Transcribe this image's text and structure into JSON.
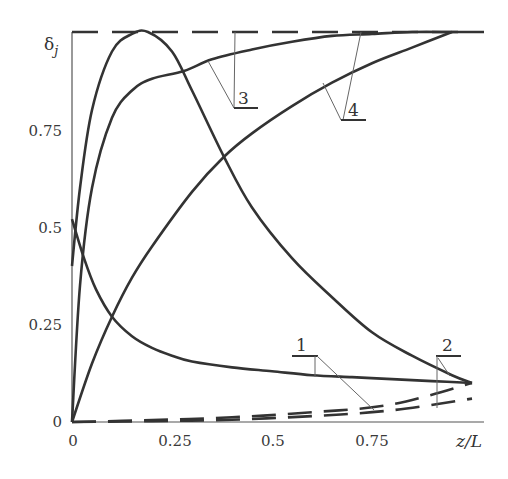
{
  "chart_data": {
    "type": "line",
    "title": "",
    "xlabel": "z/L",
    "ylabel": "δj",
    "xlim": [
      0,
      1.0
    ],
    "ylim": [
      0,
      1.0
    ],
    "grid": false,
    "legend": "leader-line curve labels",
    "x_ticks": [
      "0",
      "0.25",
      "0.5",
      "0.75"
    ],
    "y_ticks": [
      "0",
      "0.25",
      "0.5",
      "0.75"
    ],
    "reference_line": {
      "name": "upper bound (dashed)",
      "y": 1.0,
      "style": "dashed"
    },
    "series": [
      {
        "name": "1",
        "style": "solid",
        "x": [
          0,
          0.03,
          0.06,
          0.1,
          0.15,
          0.2,
          0.25,
          0.3,
          0.4,
          0.5,
          0.6,
          0.7,
          0.8,
          0.9,
          1.0
        ],
        "y": [
          0.52,
          0.42,
          0.34,
          0.27,
          0.22,
          0.19,
          0.17,
          0.155,
          0.14,
          0.13,
          0.12,
          0.115,
          0.11,
          0.105,
          0.1
        ]
      },
      {
        "name": "1",
        "style": "dashed",
        "x": [
          0,
          0.2,
          0.4,
          0.6,
          0.8,
          1.0
        ],
        "y": [
          0.0,
          0.005,
          0.012,
          0.025,
          0.045,
          0.1
        ]
      },
      {
        "name": "2",
        "style": "solid",
        "x": [
          0,
          0.02,
          0.05,
          0.1,
          0.15,
          0.19,
          0.25,
          0.3,
          0.38,
          0.45,
          0.55,
          0.65,
          0.75,
          0.85,
          0.95,
          1.0
        ],
        "y": [
          0.4,
          0.6,
          0.8,
          0.95,
          0.995,
          1.0,
          0.95,
          0.85,
          0.68,
          0.55,
          0.42,
          0.32,
          0.23,
          0.17,
          0.12,
          0.1
        ]
      },
      {
        "name": "2",
        "style": "dashed",
        "x": [
          0,
          0.2,
          0.4,
          0.6,
          0.8,
          1.0
        ],
        "y": [
          0.0,
          0.002,
          0.006,
          0.015,
          0.03,
          0.06
        ]
      },
      {
        "name": "3",
        "style": "solid",
        "x": [
          0,
          0.02,
          0.05,
          0.1,
          0.15,
          0.2,
          0.28,
          0.35,
          0.45,
          0.55,
          0.65,
          0.75,
          0.85,
          0.95,
          1.0
        ],
        "y": [
          0.0,
          0.35,
          0.6,
          0.78,
          0.85,
          0.88,
          0.9,
          0.93,
          0.955,
          0.975,
          0.99,
          0.995,
          1.0,
          1.0,
          1.0
        ]
      },
      {
        "name": "4",
        "style": "solid",
        "x": [
          0,
          0.05,
          0.1,
          0.15,
          0.2,
          0.3,
          0.38,
          0.45,
          0.55,
          0.65,
          0.75,
          0.85,
          0.95
        ],
        "y": [
          0.0,
          0.15,
          0.27,
          0.37,
          0.45,
          0.59,
          0.68,
          0.74,
          0.81,
          0.87,
          0.92,
          0.96,
          1.0
        ]
      }
    ],
    "annotations": [
      {
        "text": "1",
        "target": "curves 1 (solid & dashed)"
      },
      {
        "text": "2",
        "target": "curves 2 (solid & dashed)"
      },
      {
        "text": "3",
        "target": "curve 3 and upper bound"
      },
      {
        "text": "4",
        "target": "curve 4 and upper bound"
      }
    ]
  },
  "labels": {
    "ylabel_main": "δ",
    "ylabel_sub": "j",
    "xlabel": "z/L",
    "curve_1": "1",
    "curve_2": "2",
    "curve_3": "3",
    "curve_4": "4"
  }
}
